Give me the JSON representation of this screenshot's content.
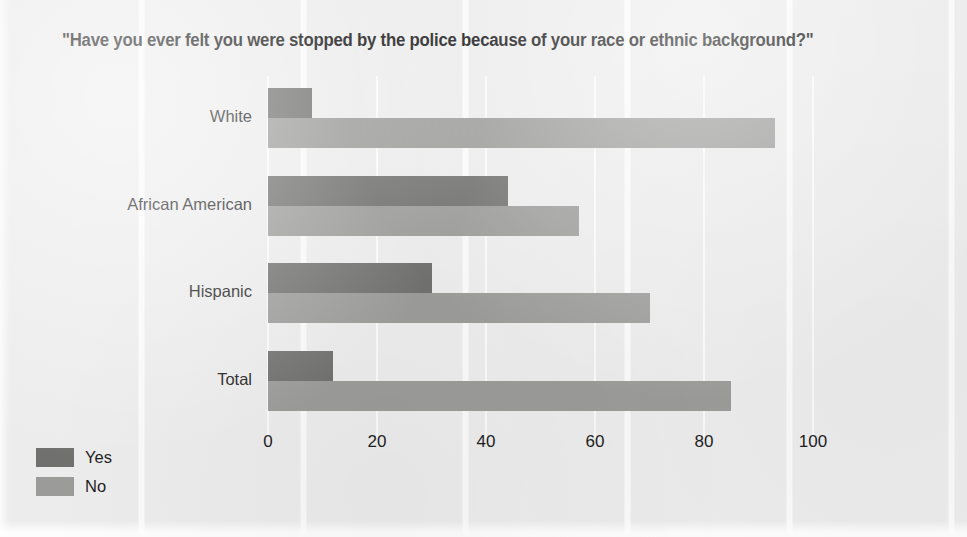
{
  "chart_data": {
    "type": "bar",
    "orientation": "horizontal",
    "title": "\"Have you ever felt you were stopped by the police because of your race or ethnic background?\"",
    "xlabel": "",
    "ylabel": "",
    "categories": [
      "White",
      "African American",
      "Hispanic",
      "Total"
    ],
    "series": [
      {
        "name": "Yes",
        "color": "#70706f",
        "values": [
          8,
          44,
          30,
          12
        ]
      },
      {
        "name": "No",
        "color": "#9b9b9a",
        "values": [
          93,
          57,
          70,
          85
        ]
      }
    ],
    "xlim": [
      0,
      100
    ],
    "xticks": [
      0,
      20,
      40,
      60,
      80,
      100
    ],
    "xtick_labels": [
      "0",
      "20",
      "40",
      "60",
      "80",
      "100"
    ],
    "grid": "vertical",
    "legend_position": "bottom-left",
    "background_color": "#ececed"
  },
  "legend": {
    "items": [
      {
        "label": "Yes"
      },
      {
        "label": "No"
      }
    ]
  }
}
